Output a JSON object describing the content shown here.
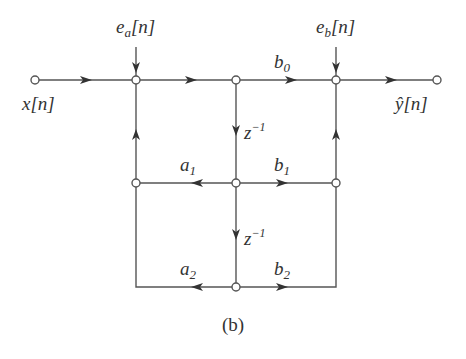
{
  "diagram": {
    "type": "signal-flow-graph",
    "caption": "(b)",
    "labels": {
      "input": "x[n]",
      "output": "ŷ[n]",
      "error_a": "e",
      "error_a_sub": "a",
      "error_a_arg": "[n]",
      "error_b": "e",
      "error_b_sub": "b",
      "error_b_arg": "[n]",
      "b0": "b",
      "b0_sub": "0",
      "b1": "b",
      "b1_sub": "1",
      "b2": "b",
      "b2_sub": "2",
      "a1": "a",
      "a1_sub": "1",
      "a2": "a",
      "a2_sub": "2",
      "delay1": "z",
      "delay1_exp": "−1",
      "delay2": "z",
      "delay2_exp": "−1"
    },
    "nodes": [
      {
        "id": "x_in",
        "x": 35,
        "y": 80
      },
      {
        "id": "sum_a",
        "x": 136,
        "y": 80
      },
      {
        "id": "w0",
        "x": 236,
        "y": 80
      },
      {
        "id": "sum_b",
        "x": 336,
        "y": 80
      },
      {
        "id": "y_out",
        "x": 437,
        "y": 80
      },
      {
        "id": "fb1",
        "x": 136,
        "y": 183
      },
      {
        "id": "w1",
        "x": 236,
        "y": 183
      },
      {
        "id": "ff1",
        "x": 336,
        "y": 183
      },
      {
        "id": "w2",
        "x": 236,
        "y": 287
      }
    ],
    "edges": [
      {
        "from": "x_in",
        "to": "sum_a",
        "gain": "1"
      },
      {
        "from": "sum_a",
        "to": "w0",
        "gain": "1"
      },
      {
        "from": "w0",
        "to": "sum_b",
        "gain": "b0"
      },
      {
        "from": "sum_b",
        "to": "y_out",
        "gain": "1"
      },
      {
        "from": "w0",
        "to": "w1",
        "gain": "z^-1"
      },
      {
        "from": "w1",
        "to": "fb1",
        "gain": "a1"
      },
      {
        "from": "w1",
        "to": "ff1",
        "gain": "b1"
      },
      {
        "from": "fb1",
        "to": "sum_a",
        "gain": "1"
      },
      {
        "from": "ff1",
        "to": "sum_b",
        "gain": "1"
      },
      {
        "from": "w1",
        "to": "w2",
        "gain": "z^-1"
      },
      {
        "from": "w2",
        "to": "fb1",
        "gain": "a2"
      },
      {
        "from": "w2",
        "to": "ff1",
        "gain": "b2"
      }
    ]
  }
}
